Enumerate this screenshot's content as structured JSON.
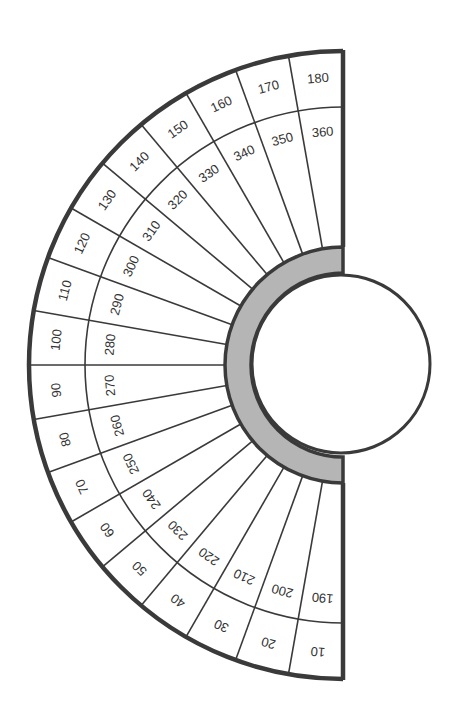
{
  "diagram": {
    "type": "semicircular-dial",
    "colors": {
      "line": "#3a3a3a",
      "outer_border": "#3a3a3a",
      "ring_fill": "#b5b5b5",
      "background": "#ffffff",
      "center_fill": "#ffffff",
      "text": "#333333"
    },
    "outer_ring_labels": [
      "10",
      "20",
      "30",
      "40",
      "50",
      "60",
      "70",
      "80",
      "90",
      "100",
      "110",
      "120",
      "130",
      "140",
      "150",
      "160",
      "170",
      "180"
    ],
    "inner_ring_labels": [
      "190",
      "200",
      "210",
      "220",
      "230",
      "240",
      "250",
      "260",
      "270",
      "280",
      "290",
      "300",
      "310",
      "320",
      "330",
      "340",
      "350",
      "360"
    ],
    "sector_span_degrees": 10,
    "sector_count": 18
  }
}
